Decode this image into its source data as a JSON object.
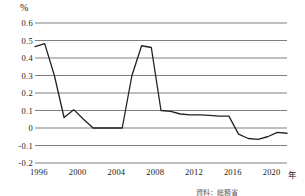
{
  "chart_data": {
    "type": "line",
    "title": "",
    "ylabel": "%",
    "xlabel": "年",
    "ylim": [
      -0.2,
      0.6
    ],
    "xlim": [
      1996,
      2022
    ],
    "grid": true,
    "legend": "none",
    "yticks": [
      "0.6",
      "0.5",
      "0.4",
      "0.3",
      "0.2",
      "0.1",
      "0",
      "-0.1",
      "-0.2"
    ],
    "ytick_values": [
      0.6,
      0.5,
      0.4,
      0.3,
      0.2,
      0.1,
      0,
      -0.1,
      -0.2
    ],
    "xticks": [
      "1996",
      "2000",
      "2004",
      "2008",
      "2012",
      "2016",
      "2020"
    ],
    "xtick_values": [
      1996,
      2000,
      2004,
      2008,
      2012,
      2016,
      2020
    ],
    "x": [
      1996,
      1997,
      1998,
      1999,
      2000,
      2001,
      2002,
      2003,
      2004,
      2005,
      2006,
      2007,
      2008,
      2009,
      2010,
      2011,
      2012,
      2013,
      2014,
      2015,
      2016,
      2017,
      2018,
      2019,
      2020,
      2021,
      2022
    ],
    "values": [
      0.465,
      0.482,
      0.3,
      0.06,
      0.105,
      0.05,
      0.0,
      0.0,
      0.0,
      0.0,
      0.3,
      0.47,
      0.46,
      0.1,
      0.095,
      0.08,
      0.075,
      0.075,
      0.072,
      0.068,
      0.068,
      -0.035,
      -0.06,
      -0.065,
      -0.05,
      -0.025,
      -0.03
    ],
    "series_color": "#222222",
    "grid_color": "#808080",
    "source_note": "資料：総務省"
  },
  "axis": {
    "unit_top": "%",
    "unit_right": "年"
  }
}
